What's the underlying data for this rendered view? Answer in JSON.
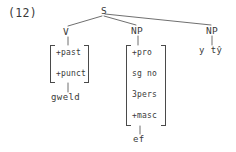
{
  "figure": {
    "example_number": "(12)",
    "caption": "",
    "language_note": ""
  },
  "tree": {
    "root": {
      "label": "S"
    },
    "branches": [
      {
        "label": "V"
      },
      {
        "label": "NP"
      },
      {
        "label": "NP"
      }
    ]
  },
  "verb_matrix": {
    "features": [
      "+past",
      "+punct"
    ],
    "terminal": "gweld"
  },
  "subject_np_matrix": {
    "features": [
      "+pro",
      "sg no",
      "3pers",
      "+masc"
    ],
    "terminal": "ef"
  },
  "object_np": {
    "terminal": "y tŷ"
  },
  "colors": {
    "background": "#ffffff",
    "ink": "#3a3a3a",
    "line": "#4a4a4a"
  }
}
